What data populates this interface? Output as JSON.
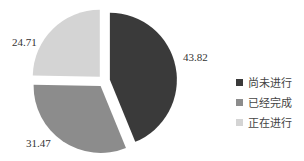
{
  "chart_data": {
    "type": "pie",
    "title": "",
    "categories": [
      "尚未进行",
      "已经完成",
      "正在进行"
    ],
    "values": [
      43.82,
      31.47,
      24.71
    ],
    "colors": [
      "#3a3a3a",
      "#8c8c8c",
      "#d4d4d4"
    ],
    "exploded": true,
    "start_angle": "top, clockwise",
    "legend_position": "right"
  },
  "labels": [
    "43.82",
    "31.47",
    "24.71"
  ],
  "legend": [
    {
      "label": "尚未进行",
      "color": "#3a3a3a"
    },
    {
      "label": "已经完成",
      "color": "#8c8c8c"
    },
    {
      "label": "正在进行",
      "color": "#d4d4d4"
    }
  ]
}
